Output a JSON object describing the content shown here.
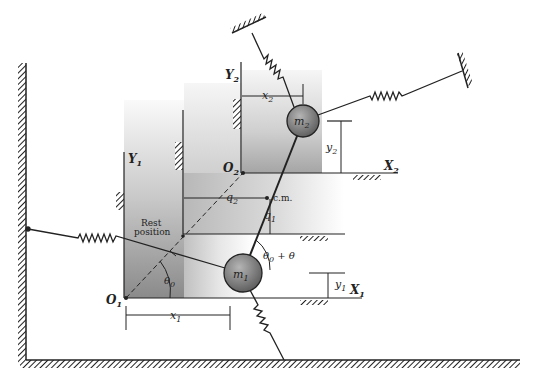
{
  "figure": {
    "type": "two-mass spring system diagram",
    "colors": {
      "ink": "#222222",
      "shade_dark": "#8c8c8c",
      "shade_light": "#f2f2f2",
      "mass_fill": "#7a7a7a"
    }
  },
  "masses": {
    "m1": {
      "base": "m",
      "sub": "1"
    },
    "m2": {
      "base": "m",
      "sub": "2"
    }
  },
  "axes": {
    "X1": {
      "base": "X",
      "sub": "1"
    },
    "Y1": {
      "base": "Y",
      "sub": "1"
    },
    "X2": {
      "base": "X",
      "sub": "2"
    },
    "Y2": {
      "base": "Y",
      "sub": "2"
    },
    "O1": {
      "base": "O",
      "sub": "1"
    },
    "O2": {
      "base": "O",
      "sub": "2"
    }
  },
  "dimensions": {
    "x1": {
      "base": "x",
      "sub": "1"
    },
    "y1": {
      "base": "y",
      "sub": "1"
    },
    "x2": {
      "base": "x",
      "sub": "2"
    },
    "y2": {
      "base": "y",
      "sub": "2"
    },
    "q1": {
      "base": "q",
      "sub": "1"
    },
    "q2": {
      "base": "q",
      "sub": "2"
    }
  },
  "angles": {
    "theta0": {
      "base": "θ",
      "sub": "0"
    },
    "theta0_plus_theta": {
      "base": "θ",
      "sub": "0",
      "suffix": " + θ"
    }
  },
  "annotations": {
    "center_of_mass": "c.m.",
    "rest_position_line1": "Rest",
    "rest_position_line2": "position"
  }
}
